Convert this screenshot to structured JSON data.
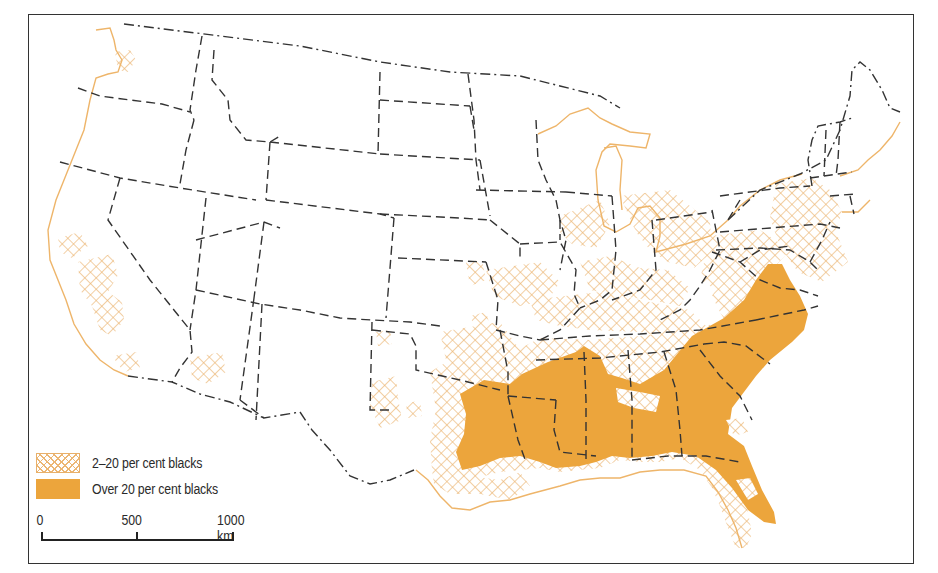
{
  "map": {
    "subject": "Distribution of black population in the conterminous United States",
    "colors": {
      "solid_fill": "#eca53c",
      "hatch": "#ecb673",
      "coastline": "#eeb56a",
      "state_border": "#333333",
      "frame": "#333333"
    }
  },
  "legend": {
    "items": [
      {
        "symbol": "cross-hatch",
        "label": "2–20 per cent blacks"
      },
      {
        "symbol": "solid",
        "label": "Over 20 per cent blacks"
      }
    ]
  },
  "scalebar": {
    "ticks": [
      "0",
      "500",
      "1000 km"
    ],
    "unit": "km",
    "max": 1000
  }
}
